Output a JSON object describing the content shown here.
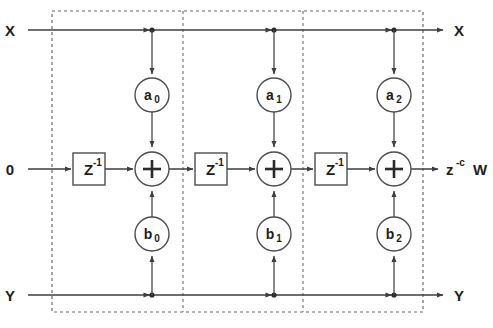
{
  "diagram": {
    "type": "signal-flow-graph",
    "colors": {
      "wire": "#3e3e3e",
      "shape_outline": "#4d4d4d",
      "dashed_box": "#6b6b6b",
      "text": "#1d1d1d",
      "background": "#ffffff"
    },
    "io_labels": {
      "x_in": "X",
      "x_out": "X",
      "zero_in": "0",
      "y_in": "Y",
      "y_out": "Y",
      "w_out_base": "z",
      "w_out_exponent": "-c",
      "w_out_symbol": "W"
    },
    "delay_label": {
      "base": "Z",
      "exponent": "-1"
    },
    "adder_symbol": "+",
    "sections": [
      {
        "index": 0,
        "feedforward_coefficient": "a",
        "feedforward_subscript": "0",
        "feedback_coefficient": "b",
        "feedback_subscript": "0",
        "delay": "Z -1",
        "adder": "+"
      },
      {
        "index": 1,
        "feedforward_coefficient": "a",
        "feedforward_subscript": "1",
        "feedback_coefficient": "b",
        "feedback_subscript": "1",
        "delay": "Z -1",
        "adder": "+"
      },
      {
        "index": 2,
        "feedforward_coefficient": "a",
        "feedforward_subscript": "2",
        "feedback_coefficient": "b",
        "feedback_subscript": "2",
        "delay": "Z -1",
        "adder": "+"
      }
    ]
  }
}
